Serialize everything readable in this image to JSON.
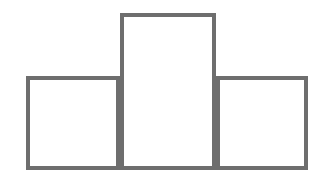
{
  "figure": {
    "kind": "histogram-outline-figure",
    "background_color": "#ffffff",
    "stroke_color": "#6e6e6e",
    "stroke_width": 4,
    "canvas": {
      "width": 328,
      "height": 185
    }
  },
  "chart_data": {
    "type": "bar",
    "title": "",
    "subtitle": "",
    "xlabel": "",
    "ylabel": "",
    "categories": [
      "1",
      "2",
      "3"
    ],
    "values": [
      94,
      157,
      94
    ],
    "ylim": [
      0,
      172
    ],
    "xlim": [
      26,
      308
    ],
    "grid": false,
    "legend": null,
    "legend_position": "none",
    "tick_labels_x": [],
    "tick_labels_y": [],
    "annotations": [],
    "style": {
      "fill": "#ffffff",
      "edge_color": "#6e6e6e",
      "edge_width": 4,
      "bars_adjacent": true
    },
    "bars": [
      {
        "name": "left-bar",
        "x0": 26,
        "x1": 120,
        "top": 76,
        "bottom": 170,
        "width": 94,
        "height": 94
      },
      {
        "name": "middle-bar",
        "x0": 120,
        "x1": 216,
        "top": 13,
        "bottom": 170,
        "width": 96,
        "height": 157
      },
      {
        "name": "right-bar",
        "x0": 216,
        "x1": 308,
        "top": 76,
        "bottom": 170,
        "width": 92,
        "height": 94
      }
    ],
    "baseline": {
      "y": 170,
      "x0": 26,
      "x1": 308
    }
  }
}
